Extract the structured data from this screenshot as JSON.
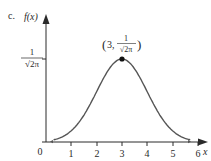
{
  "header": {
    "cutoff_text": "a. μ = 3, σ = 1",
    "part_label": "c."
  },
  "chart_data": {
    "type": "line",
    "title": "",
    "xlabel": "x",
    "ylabel": "f(x)",
    "x_ticks": [
      "0",
      "1",
      "2",
      "3",
      "4",
      "5",
      "6"
    ],
    "y_tick_label": {
      "numerator": "1",
      "denominator": "√2π",
      "value": 0.3989
    },
    "xlim": [
      0,
      6
    ],
    "ylim": [
      0,
      0.45
    ],
    "series": [
      {
        "name": "normal density, mean 3, sd 1",
        "mean": 3,
        "sd": 1,
        "x": [
          0.2,
          0.5,
          1,
          1.5,
          2,
          2.5,
          3,
          3.5,
          4,
          4.5,
          5,
          5.5,
          5.8
        ],
        "y": [
          0.0079,
          0.0175,
          0.054,
          0.1295,
          0.242,
          0.3521,
          0.3989,
          0.3521,
          0.242,
          0.1295,
          0.054,
          0.0175,
          0.0079
        ]
      }
    ],
    "annotations": [
      {
        "point": [
          3,
          0.3989
        ],
        "text_left": "(3, ",
        "numerator": "1",
        "denominator": "√2π",
        "text_right": ")"
      }
    ],
    "grid": false,
    "legend": "none"
  }
}
